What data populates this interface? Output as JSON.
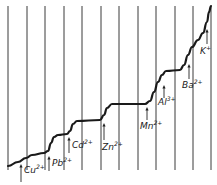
{
  "diagram": {
    "type": "stepwise polarogram curve",
    "colors": {
      "line": "#3a3a3a",
      "curve": "#1a1a1a",
      "background": "#ffffff"
    },
    "grid_lines_x": [
      8,
      27,
      45,
      64,
      82,
      101,
      119,
      138,
      156,
      175,
      193,
      211
    ],
    "grid_line_top": 6,
    "grid_line_bottom": 170,
    "curve_points": [
      [
        8,
        166
      ],
      [
        18,
        162
      ],
      [
        26,
        158
      ],
      [
        32,
        155
      ],
      [
        44,
        153
      ],
      [
        48,
        151
      ],
      [
        51,
        143
      ],
      [
        54,
        137
      ],
      [
        58,
        135
      ],
      [
        67,
        134
      ],
      [
        70,
        131
      ],
      [
        73,
        124
      ],
      [
        77,
        121
      ],
      [
        100,
        120
      ],
      [
        104,
        115
      ],
      [
        107,
        108
      ],
      [
        112,
        104
      ],
      [
        145,
        104
      ],
      [
        150,
        101
      ],
      [
        154,
        92
      ],
      [
        158,
        82
      ],
      [
        162,
        75
      ],
      [
        166,
        71
      ],
      [
        180,
        70
      ],
      [
        184,
        65
      ],
      [
        188,
        55
      ],
      [
        192,
        47
      ],
      [
        198,
        40
      ],
      [
        203,
        33
      ],
      [
        207,
        22
      ],
      [
        209,
        12
      ],
      [
        211,
        6
      ]
    ],
    "labels": [
      {
        "ion": "Cu",
        "charge": "2+",
        "arrow_x": 21,
        "arrow_top": 164,
        "arrow_bottom": 182,
        "text_x": 24,
        "text_y": 164
      },
      {
        "ion": "Pb",
        "charge": "2+",
        "arrow_x": 49,
        "arrow_top": 156,
        "arrow_bottom": 171,
        "text_x": 52,
        "text_y": 157
      },
      {
        "ion": "Cd",
        "charge": "2+",
        "arrow_x": 69,
        "arrow_top": 137,
        "arrow_bottom": 153,
        "text_x": 72,
        "text_y": 139
      },
      {
        "ion": "Zn",
        "charge": "2+",
        "arrow_x": 104,
        "arrow_top": 123,
        "arrow_bottom": 140,
        "text_x": 102,
        "text_y": 141
      },
      {
        "ion": "Mn",
        "charge": "2+",
        "arrow_x": 147,
        "arrow_top": 107,
        "arrow_bottom": 120,
        "text_x": 140,
        "text_y": 120
      },
      {
        "ion": "Al",
        "charge": "3+",
        "arrow_x": 164,
        "arrow_top": 85,
        "arrow_bottom": 98,
        "text_x": 158,
        "text_y": 96
      },
      {
        "ion": "Ba",
        "charge": "2+",
        "arrow_x": 189,
        "arrow_top": 64,
        "arrow_bottom": 79,
        "text_x": 182,
        "text_y": 79
      },
      {
        "ion": "K",
        "charge": "+",
        "arrow_x": 207,
        "arrow_top": 29,
        "arrow_bottom": 44,
        "text_x": 200,
        "text_y": 45
      }
    ]
  }
}
